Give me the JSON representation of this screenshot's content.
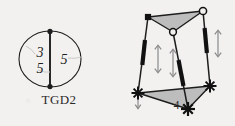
{
  "page": {
    "background_color": "#f2f1ef",
    "ink_color": "#1d1d1d",
    "shade_color": "#b9b9b9",
    "arrow_color": "#8a8a8a"
  },
  "figures": [
    {
      "id": "tgd2-circle",
      "caption": "TGD2",
      "type": "circle-with-chord",
      "labels": {
        "left_top": "3",
        "left_bottom": "5",
        "right": "5"
      },
      "vertices": [
        {
          "name": "chord-top-node",
          "marker": "filled-dot"
        },
        {
          "name": "chord-bottom-node",
          "marker": "filled-dot"
        }
      ]
    },
    {
      "id": "prism-frame",
      "caption": "4",
      "type": "triangular-prism-frame",
      "faces": [
        {
          "name": "top-triangle",
          "fill": "shaded"
        },
        {
          "name": "bottom-triangle",
          "fill": "shaded"
        }
      ],
      "vertices": [
        {
          "name": "top-left-vertex",
          "marker": "filled-square"
        },
        {
          "name": "top-right-vertex",
          "marker": "open-circle"
        },
        {
          "name": "top-mid-vertex",
          "marker": "open-circle"
        },
        {
          "name": "bottom-left-vertex",
          "marker": "cross"
        },
        {
          "name": "bottom-right-vertex",
          "marker": "cross"
        },
        {
          "name": "bottom-front-vertex",
          "marker": "cross"
        }
      ],
      "legs": [
        {
          "name": "left-leg",
          "thick_segment": true,
          "arrow": "double-headed-vertical"
        },
        {
          "name": "middle-leg",
          "thick_segment": true,
          "arrow": "double-headed-vertical"
        },
        {
          "name": "right-leg",
          "thick_segment": true,
          "arrow": "double-headed-vertical"
        }
      ],
      "extra_arrows": [
        {
          "name": "bottom-left-support-arrow",
          "direction": "down"
        }
      ]
    }
  ]
}
